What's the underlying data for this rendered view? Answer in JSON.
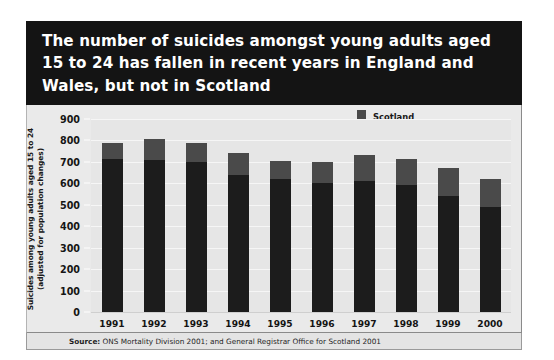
{
  "title": "The number of suicides amongst young adults aged\n15 to 24 has fallen in recent years in England and\nWales, but not in Scotland",
  "source": {
    "label": "Source:",
    "text": " ONS Mortality Division 2001; and General Registrar Office for Scotland 2001"
  },
  "legend": {
    "items": [
      {
        "label": "Scotland",
        "color": "#4a4a4a"
      },
      {
        "label": "England and Wales",
        "color": "#1c1c1c"
      }
    ]
  },
  "chart_data": {
    "type": "bar",
    "title": "The number of suicides amongst young adults aged 15 to 24 has fallen in recent years in England and Wales, but not in Scotland",
    "subtitle": "",
    "stacked": true,
    "xlabel": "",
    "ylabel": "Suicides among young adults aged 15 to 24\n(adjusted for population changes)",
    "ylim": [
      0,
      900
    ],
    "yticks": [
      0,
      100,
      200,
      300,
      400,
      500,
      600,
      700,
      800,
      900
    ],
    "ytick_labels": [
      "0",
      "100",
      "200",
      "300",
      "400",
      "500",
      "600",
      "700",
      "800",
      "900"
    ],
    "grid": true,
    "legend_position": "top-right",
    "categories": [
      "1991",
      "1992",
      "1993",
      "1994",
      "1995",
      "1996",
      "1997",
      "1998",
      "1999",
      "2000"
    ],
    "series": [
      {
        "name": "England and Wales",
        "color": "#1c1c1c",
        "values": [
          715,
          710,
          700,
          640,
          620,
          600,
          610,
          590,
          540,
          490
        ]
      },
      {
        "name": "Scotland",
        "color": "#4a4a4a",
        "values": [
          75,
          95,
          90,
          100,
          85,
          100,
          120,
          125,
          130,
          130
        ]
      }
    ],
    "totals": [
      790,
      805,
      790,
      740,
      705,
      700,
      730,
      715,
      670,
      620
    ],
    "source": "Source: ONS Mortality Division 2001; and General Registrar Office for Scotland 2001"
  }
}
